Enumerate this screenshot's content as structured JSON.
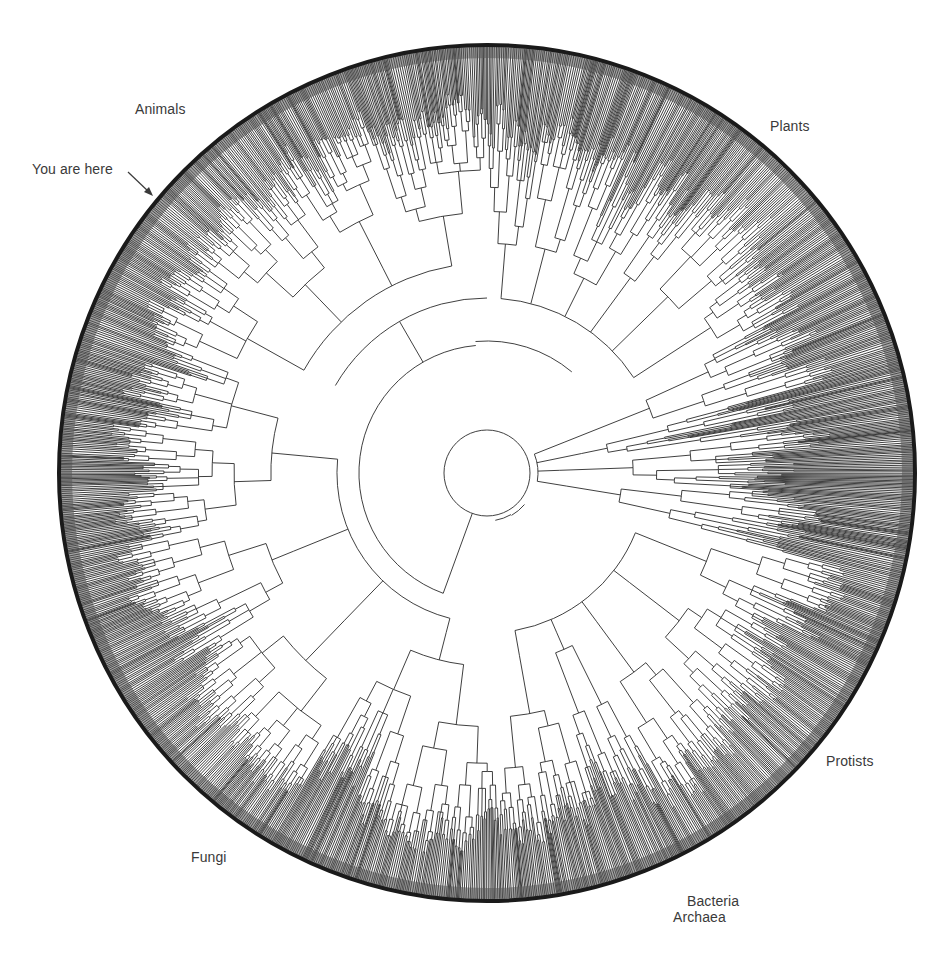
{
  "figure": {
    "type": "circular-phylogenetic-tree",
    "colors": {
      "background": "#ffffff",
      "branch": "#2a2a2a",
      "rim": "#1a1a1a",
      "label": "#3a3a3a"
    },
    "center": {
      "x": 487,
      "y": 473
    },
    "radius": 428,
    "inner_circle_radius": 43
  },
  "labels": {
    "animals": "Animals",
    "you_are_here": "You are here",
    "plants": "Plants",
    "protists": "Protists",
    "fungi": "Fungi",
    "bacteria": "Bacteria",
    "archaea": "Archaea"
  },
  "clades": [
    {
      "name": "Animals",
      "start_deg": 178,
      "end_deg": 292,
      "density": 1.0
    },
    {
      "name": "Plants",
      "start_deg": 292,
      "end_deg": 360,
      "density": 0.9
    },
    {
      "name": "Protists",
      "start_deg": 0,
      "end_deg": 62,
      "density": 0.85
    },
    {
      "name": "Bacteria/Archaea",
      "start_deg": 62,
      "end_deg": 105,
      "density": 0.95
    },
    {
      "name": "Fungi",
      "start_deg": 105,
      "end_deg": 178,
      "density": 1.0
    }
  ]
}
